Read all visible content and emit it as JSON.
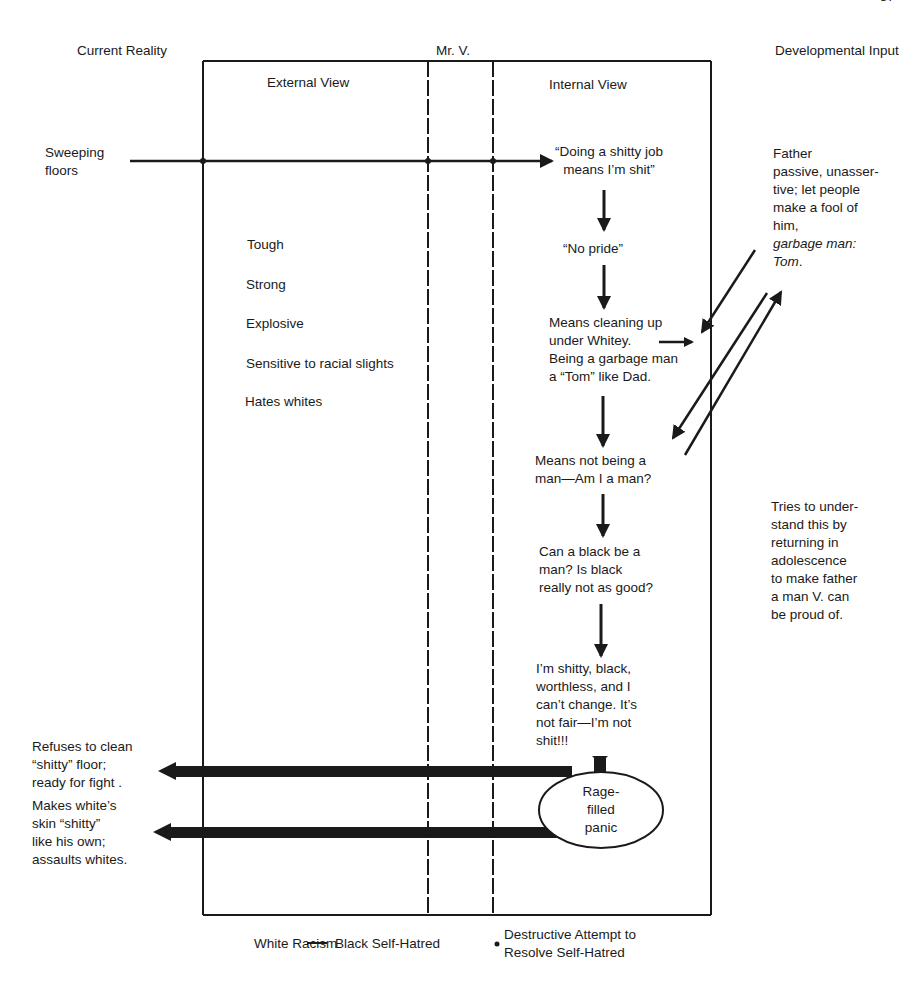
{
  "page_number": "87",
  "headers": {
    "left": "Current Reality",
    "center": "Mr. V.",
    "right": "Developmental Input"
  },
  "columns": {
    "external": "External View",
    "internal": "Internal View"
  },
  "current_reality": {
    "stimulus": "Sweeping\nfloors",
    "response_1": "Refuses to clean\n“shitty” floor;\nready for fight .",
    "response_2": "Makes white’s\nskin “shitty”\nlike his own;\nassaults whites."
  },
  "external_traits": [
    "Tough",
    "Strong",
    "Explosive",
    "Sensitive to racial slights",
    "Hates whites"
  ],
  "internal_chain": [
    "“Doing a shitty job\nmeans I’m shit”",
    "“No pride”",
    "Means cleaning up\nunder Whitey.\nBeing a garbage man\na “Tom” like Dad.",
    "Means not being a\nman—Am I a man?",
    "Can a black be a\nman? Is black\nreally not as good?",
    "I’m shitty, black,\nworthless, and I\ncan’t change. It’s\nnot fair—I’m not\nshit!!!"
  ],
  "ellipse": "Rage-\nfilled\npanic",
  "developmental_input": {
    "father": "Father\npassive, unasser-\ntive; let people\nmake a fool of\nhim,",
    "father_italic": "garbage man:\nTom",
    "father_period": ".",
    "adolescence": "Tries to under-\nstand this by\nreturning in\nadolescence\nto make father\na man V. can\nbe proud of."
  },
  "footer": {
    "white_racism": "White Racism",
    "black_self_hatred": "Black Self-Hatred",
    "destructive": "Destructive Attempt to\nResolve Self-Hatred"
  },
  "colors": {
    "ink": "#1a1a1a",
    "paper": "#ffffff"
  }
}
